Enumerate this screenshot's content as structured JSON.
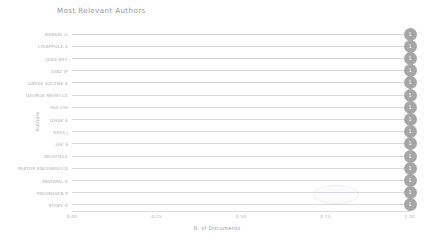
{
  "chart_data": {
    "type": "bar",
    "title": "Most Relevant Authors",
    "xlabel": "N. of Documents",
    "ylabel": "Authors",
    "xlim": [
      0,
      1
    ],
    "xticks": [
      "0.00",
      "0.25",
      "0.50",
      "0.75",
      "1.00"
    ],
    "grid": false,
    "legend": null,
    "marker_label_format": "1",
    "categories": [
      "BANSAL G",
      "CHIAPPOLA V",
      "DIAZ JEFF",
      "DIAZ JP",
      "GARZA AZCENA A",
      "GEORGE NEHEI CE",
      "HUI CHI",
      "IZHAK A",
      "KEES J",
      "LEE S",
      "NICHITELE",
      "PAKTOR ANGURROO D",
      "RAVIZPAL K",
      "PREUKOVEN P",
      "STOKE Z"
    ],
    "values": [
      1,
      1,
      1,
      1,
      1,
      1,
      1,
      1,
      1,
      1,
      1,
      1,
      1,
      1,
      1
    ],
    "value_labels": [
      "1",
      "1",
      "1",
      "1",
      "1",
      "1",
      "1",
      "1",
      "1",
      "1",
      "1",
      "1",
      "1",
      "1",
      "1"
    ]
  },
  "colors": {
    "marker": "#a6a6a6",
    "marker_label": "#ffffff",
    "line": "#d8d8d8",
    "axis": "#dcdcdc",
    "text": "#a8a8a8",
    "title": "#9a9a9a",
    "background": "#ffffff"
  }
}
